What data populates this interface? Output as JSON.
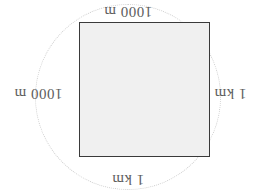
{
  "figure": {
    "background_color": "#ffffff",
    "square": {
      "fill_color": "#f0f0f0",
      "stroke_color": "#3a3a3a"
    },
    "circle": {
      "style": "dotted",
      "stroke_color": "#cfcfcf"
    },
    "orientation": "rotated-180",
    "labels": {
      "top": "1000 m",
      "bottom": "1 km",
      "left": "1000 m",
      "right": "1 km"
    }
  },
  "chart_data": {
    "type": "diagram",
    "shape": "square-inscribed-in-circle",
    "title": "",
    "annotations": [
      {
        "position": "top",
        "text": "1000 m",
        "value": 1000,
        "unit": "m"
      },
      {
        "position": "right",
        "text": "1 km",
        "value": 1,
        "unit": "km"
      },
      {
        "position": "bottom",
        "text": "1 km",
        "value": 1,
        "unit": "km"
      },
      {
        "position": "left",
        "text": "1000 m",
        "value": 1000,
        "unit": "m"
      }
    ]
  }
}
